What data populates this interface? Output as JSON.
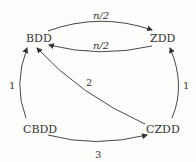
{
  "diagram": {
    "type": "directed-graph",
    "nodes": [
      {
        "id": "BDD",
        "label": "BDD"
      },
      {
        "id": "ZDD",
        "label": "ZDD"
      },
      {
        "id": "CBDD",
        "label": "CBDD"
      },
      {
        "id": "CZDD",
        "label": "CZDD"
      }
    ],
    "edges": [
      {
        "from": "BDD",
        "to": "ZDD",
        "label": "n/2"
      },
      {
        "from": "ZDD",
        "to": "BDD",
        "label": "n/2"
      },
      {
        "from": "CBDD",
        "to": "BDD",
        "label": "1"
      },
      {
        "from": "CZDD",
        "to": "ZDD",
        "label": "1"
      },
      {
        "from": "CZDD",
        "to": "BDD",
        "label": "2"
      },
      {
        "from": "CBDD",
        "to": "CZDD",
        "label": "3"
      }
    ]
  },
  "colors": {
    "stroke": "#333333",
    "background": "#fdfdfc"
  }
}
